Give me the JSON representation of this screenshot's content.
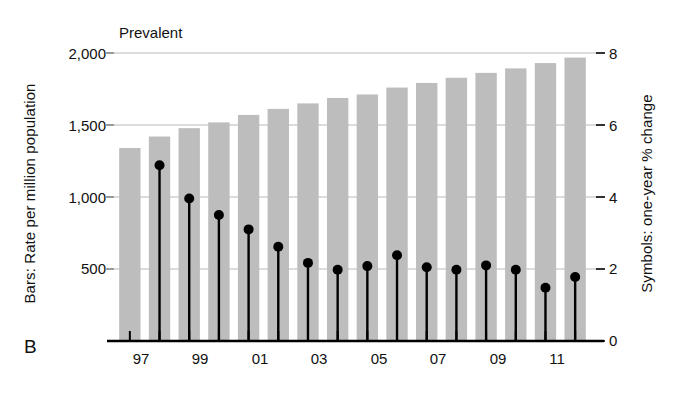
{
  "panel": {
    "label": "B"
  },
  "chart_data": {
    "type": "bar",
    "title": "Prevalent",
    "xlabel": "",
    "ylabel": "Bars: Rate per million population",
    "ylabel_right": "Symbols: one-year % change",
    "ylim": [
      0,
      2000
    ],
    "ylim_right": [
      0,
      8
    ],
    "yticks": [
      500,
      1000,
      1500,
      2000
    ],
    "ytick_labels": [
      "500",
      "1,500",
      "1,000",
      "2,000"
    ],
    "yticks_right": [
      0,
      2,
      4,
      6,
      8
    ],
    "grid": true,
    "legend": "none",
    "bar_color": "#bdbdbd",
    "symbol_color": "#000000",
    "categories": [
      "96",
      "97",
      "98",
      "99",
      "00",
      "01",
      "02",
      "03",
      "04",
      "05",
      "06",
      "07",
      "08",
      "09",
      "10",
      "11"
    ],
    "xtick_labels_shown": [
      "97",
      "99",
      "01",
      "03",
      "05",
      "07",
      "09",
      "11"
    ],
    "series": [
      {
        "name": "Bars: Rate per million population",
        "axis": "left",
        "type": "bar",
        "values": [
          1340,
          1420,
          1478,
          1518,
          1570,
          1612,
          1650,
          1688,
          1712,
          1760,
          1792,
          1828,
          1862,
          1893,
          1930,
          1968
        ]
      },
      {
        "name": "Symbols: one-year % change",
        "axis": "right",
        "type": "stem",
        "values": [
          null,
          4.88,
          3.96,
          3.5,
          3.1,
          2.62,
          2.17,
          1.98,
          2.08,
          2.38,
          2.05,
          1.98,
          2.1,
          1.98,
          1.48,
          1.78
        ]
      }
    ]
  },
  "axis_labels": {
    "left_y_2000": "2,000",
    "left_y_1500": "1,500",
    "left_y_1000": "1,000",
    "left_y_500": "500",
    "right_y_8": "8",
    "right_y_6": "6",
    "right_y_4": "4",
    "right_y_2": "2",
    "right_y_0": "0",
    "x_97": "97",
    "x_99": "99",
    "x_01": "01",
    "x_03": "03",
    "x_05": "05",
    "x_07": "07",
    "x_09": "09",
    "x_11": "11"
  }
}
